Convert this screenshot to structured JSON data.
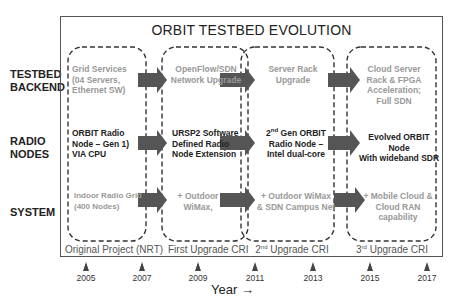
{
  "title": "ORBIT TESTBED EVOLUTION",
  "row_labels": {
    "backend": [
      "TESTBED",
      "BACKEND"
    ],
    "radio": [
      "RADIO",
      "NODES"
    ],
    "system": [
      "SYSTEM"
    ]
  },
  "phases": [
    {
      "label": "Original Project (NRT)",
      "backend": [
        "Grid Services",
        "(04 Servers,",
        "Ethernet SW)"
      ],
      "radio": [
        "ORBIT Radio",
        "Node – Gen 1)",
        "VIA CPU"
      ],
      "system": [
        "Indoor Radio Grid",
        "(400 Nodes)"
      ]
    },
    {
      "label": "First Upgrade CRI",
      "backend": [
        "OpenFlow/SDN",
        "Network Upgrade"
      ],
      "radio": [
        "URSP2 Software",
        "Defined Radio",
        "Node Extension"
      ],
      "system": [
        "+ Outdoor",
        "WiMax,"
      ]
    },
    {
      "label_prefix": "2",
      "label_sup": "nd",
      "label_suffix": " Upgrade CRI",
      "backend": [
        "Server Rack",
        "Upgrade"
      ],
      "radio_line1_prefix": "2",
      "radio_line1_sup": "nd",
      "radio_line1_suffix": " Gen ORBIT",
      "radio": [
        "Radio Node –",
        "Intel dual-core"
      ],
      "system": [
        "+ Outdoor WiMax",
        "& SDN Campus Net"
      ]
    },
    {
      "label_prefix": "3",
      "label_sup": "rd",
      "label_suffix": " Upgrade CRI",
      "backend": [
        "Cloud Server",
        "Rack  & FPGA",
        "Acceleration;",
        "Full SDN"
      ],
      "radio": [
        "Evolved ORBIT Node",
        "With wideband SDR"
      ],
      "system": [
        "+ Mobile Cloud &",
        "Cloud RAN capability"
      ]
    }
  ],
  "timeline": {
    "years": [
      "2005",
      "2007",
      "2009",
      "2011",
      "2013",
      "2015",
      "2017"
    ],
    "axis_label": "Year →"
  },
  "colors": {
    "arrow_fill": "#555555",
    "dashed_border": "#333333",
    "gray_text": "#999999",
    "dark_text": "#222222"
  }
}
